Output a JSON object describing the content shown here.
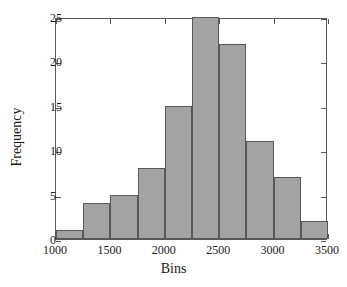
{
  "chart_data": {
    "type": "bar",
    "title": "",
    "xlabel": "Bins",
    "ylabel": "Frequency",
    "xlim": [
      1000,
      3500
    ],
    "ylim": [
      0,
      25
    ],
    "grid": false,
    "legend": null,
    "bin_width": 250,
    "bin_edges": [
      1000,
      1250,
      1500,
      1750,
      2000,
      2250,
      2500,
      2750,
      3000,
      3250,
      3500
    ],
    "categories": [
      "1000-1250",
      "1250-1500",
      "1500-1750",
      "1750-2000",
      "2000-2250",
      "2250-2500",
      "2500-2750",
      "2750-3000",
      "3000-3250",
      "3250-3500"
    ],
    "values": [
      1,
      4,
      5,
      8,
      15,
      25,
      22,
      11,
      7,
      2
    ],
    "xticks": [
      {
        "value": 1000,
        "label": "1000"
      },
      {
        "value": 1500,
        "label": "1500"
      },
      {
        "value": 2000,
        "label": "2000"
      },
      {
        "value": 2500,
        "label": "2500"
      },
      {
        "value": 3000,
        "label": "3000"
      },
      {
        "value": 3500,
        "label": "3500"
      }
    ],
    "yticks": [
      {
        "value": 0,
        "label": "0"
      },
      {
        "value": 5,
        "label": "5"
      },
      {
        "value": 10,
        "label": "10"
      },
      {
        "value": 15,
        "label": "15"
      },
      {
        "value": 20,
        "label": "20"
      },
      {
        "value": 25,
        "label": "25"
      }
    ],
    "colors": {
      "bar_fill": "#a3a3a3",
      "bar_edge": "#585858",
      "axis": "#595959",
      "text": "#1a1a1a",
      "background": "#ffffff"
    }
  }
}
